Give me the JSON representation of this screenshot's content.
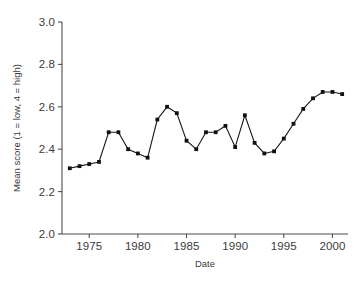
{
  "chart_data": {
    "type": "line",
    "title": "",
    "subtitle": "",
    "xlabel": "Date",
    "ylabel": "Mean score (1 = low, 4 = high)",
    "xlim": [
      1972.2,
      2001.6
    ],
    "ylim": [
      2.0,
      3.0
    ],
    "xticks": [
      1975,
      1980,
      1985,
      1990,
      1995,
      2000
    ],
    "xtick_labels": [
      "1975",
      "1980",
      "1985",
      "1990",
      "1995",
      "2000"
    ],
    "yticks": [
      2.0,
      2.2,
      2.4,
      2.6,
      2.8,
      3.0
    ],
    "ytick_labels": [
      "2.0",
      "2.2",
      "2.4",
      "2.6",
      "2.8",
      "3.0"
    ],
    "grid": false,
    "legend": false,
    "legend_position": "none",
    "marker": "square",
    "marker_color": "#111111",
    "line_color": "#151515",
    "axis_color": "#4c4c4c",
    "x": [
      1973,
      1974,
      1975,
      1976,
      1977,
      1978,
      1979,
      1980,
      1981,
      1982,
      1983,
      1984,
      1985,
      1986,
      1987,
      1988,
      1989,
      1990,
      1991,
      1992,
      1993,
      1994,
      1995,
      1996,
      1997,
      1998,
      1999,
      2000,
      2001
    ],
    "values": [
      2.31,
      2.32,
      2.33,
      2.34,
      2.48,
      2.48,
      2.4,
      2.38,
      2.36,
      2.54,
      2.6,
      2.57,
      2.44,
      2.4,
      2.48,
      2.48,
      2.51,
      2.41,
      2.56,
      2.43,
      2.38,
      2.39,
      2.45,
      2.52,
      2.59,
      2.64,
      2.67,
      2.67,
      2.66
    ],
    "series": [
      {
        "name": "Mean score",
        "values": [
          2.31,
          2.32,
          2.33,
          2.34,
          2.48,
          2.48,
          2.4,
          2.38,
          2.36,
          2.54,
          2.6,
          2.57,
          2.44,
          2.4,
          2.48,
          2.48,
          2.51,
          2.41,
          2.56,
          2.43,
          2.38,
          2.39,
          2.45,
          2.52,
          2.59,
          2.64,
          2.67,
          2.67,
          2.66
        ]
      }
    ]
  },
  "geometry": {
    "plot_left": 62,
    "plot_right": 348,
    "plot_top": 22,
    "plot_bottom": 234
  }
}
